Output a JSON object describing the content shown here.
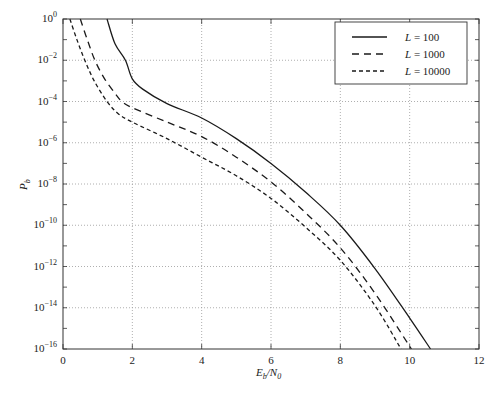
{
  "chart_data": {
    "type": "line",
    "title": "",
    "xlabel": "E_b/N_0",
    "ylabel": "P_b",
    "xlim": [
      0,
      12
    ],
    "ylim_log10": [
      -16,
      0
    ],
    "yscale": "log",
    "grid": true,
    "legend_position": "upper right",
    "x_ticks": [
      0,
      2,
      4,
      6,
      8,
      10,
      12
    ],
    "y_ticks_exponents": [
      0,
      -2,
      -4,
      -6,
      -8,
      -10,
      -12,
      -14,
      -16
    ],
    "y_tick_labels": [
      "10^0",
      "10^-2",
      "10^-4",
      "10^-6",
      "10^-8",
      "10^-10",
      "10^-12",
      "10^-14",
      "10^-16"
    ],
    "series": [
      {
        "name": "L = 100",
        "style": "solid",
        "x": [
          1.27,
          1.5,
          1.8,
          2.0,
          2.3,
          3.0,
          4.0,
          5.0,
          6.0,
          7.0,
          8.0,
          9.0,
          10.0,
          10.6
        ],
        "log10P": [
          0,
          -1.2,
          -2.0,
          -2.9,
          -3.4,
          -4.1,
          -4.8,
          -5.8,
          -7.0,
          -8.4,
          -10.0,
          -12.1,
          -14.5,
          -16
        ]
      },
      {
        "name": "L = 1000",
        "style": "dashed",
        "x": [
          0.5,
          0.7,
          0.92,
          1.2,
          1.5,
          1.7,
          2.0,
          3.0,
          4.0,
          5.0,
          6.0,
          7.0,
          8.0,
          9.0,
          10.05
        ],
        "log10P": [
          0,
          -1.0,
          -2.0,
          -2.9,
          -3.6,
          -4.0,
          -4.3,
          -5.0,
          -5.7,
          -6.7,
          -7.9,
          -9.4,
          -11.1,
          -13.3,
          -16
        ]
      },
      {
        "name": "L = 10000",
        "style": "dotted-dash",
        "x": [
          0.2,
          0.4,
          0.63,
          0.9,
          1.27,
          1.6,
          2.0,
          3.0,
          4.0,
          5.0,
          6.0,
          7.0,
          8.0,
          9.0,
          9.75
        ],
        "log10P": [
          0,
          -1.0,
          -2.0,
          -3.0,
          -4.0,
          -4.6,
          -5.0,
          -5.8,
          -6.7,
          -7.6,
          -8.7,
          -10.1,
          -11.7,
          -13.9,
          -16
        ]
      }
    ]
  },
  "legend": {
    "items": [
      {
        "label": "L = 100",
        "style": "solid"
      },
      {
        "label": "L = 1000",
        "style": "dashed"
      },
      {
        "label": "L = 10000",
        "style": "dotted-dash"
      }
    ]
  },
  "axes": {
    "xlabel_main": "E",
    "xlabel_sub1": "b",
    "xlabel_slash": "/N",
    "xlabel_sub2": "0",
    "ylabel_main": "P",
    "ylabel_sub": "b"
  },
  "colors": {
    "line": "#1a1a1a",
    "axis": "#333333",
    "grid": "#9a9a9a",
    "background": "#ffffff"
  }
}
